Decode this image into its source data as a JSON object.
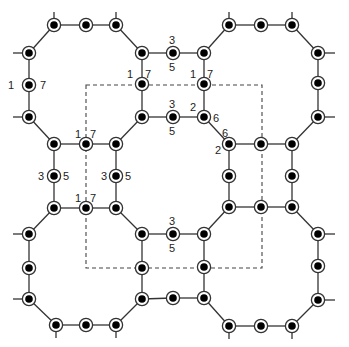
{
  "diagram": {
    "colors": {
      "line": "#333333",
      "node_fill": "#000000",
      "node_ring": "#333333",
      "dashed": "#444444",
      "label": "#222222"
    },
    "nodes": [
      {
        "id": "n1",
        "x": 54,
        "y": 25
      },
      {
        "id": "n2",
        "x": 86,
        "y": 25
      },
      {
        "id": "n3",
        "x": 116,
        "y": 25
      },
      {
        "id": "n4",
        "x": 29,
        "y": 53
      },
      {
        "id": "n5",
        "x": 142,
        "y": 53
      },
      {
        "id": "n6",
        "x": 173,
        "y": 53
      },
      {
        "id": "n7",
        "x": 29,
        "y": 85
      },
      {
        "id": "n8",
        "x": 142,
        "y": 84
      },
      {
        "id": "n9",
        "x": 29,
        "y": 117
      },
      {
        "id": "n10",
        "x": 142,
        "y": 117
      },
      {
        "id": "n11",
        "x": 173,
        "y": 117
      },
      {
        "id": "n12",
        "x": 54,
        "y": 144
      },
      {
        "id": "n13",
        "x": 86,
        "y": 144
      },
      {
        "id": "n14",
        "x": 116,
        "y": 144
      },
      {
        "id": "n15",
        "x": 54,
        "y": 176
      },
      {
        "id": "n16",
        "x": 116,
        "y": 176
      },
      {
        "id": "n17",
        "x": 54,
        "y": 208
      },
      {
        "id": "n18",
        "x": 86,
        "y": 208
      },
      {
        "id": "n19",
        "x": 116,
        "y": 208
      },
      {
        "id": "n20",
        "x": 29,
        "y": 234
      },
      {
        "id": "n21",
        "x": 142,
        "y": 234
      },
      {
        "id": "n22",
        "x": 173,
        "y": 234
      },
      {
        "id": "n23",
        "x": 29,
        "y": 268
      },
      {
        "id": "n24",
        "x": 142,
        "y": 268
      },
      {
        "id": "n25",
        "x": 29,
        "y": 299
      },
      {
        "id": "n26",
        "x": 142,
        "y": 299
      },
      {
        "id": "n27",
        "x": 173,
        "y": 298
      },
      {
        "id": "n28",
        "x": 56,
        "y": 325
      },
      {
        "id": "n29",
        "x": 86,
        "y": 325
      },
      {
        "id": "n30",
        "x": 116,
        "y": 325
      },
      {
        "id": "m1",
        "x": 229,
        "y": 25
      },
      {
        "id": "m2",
        "x": 261,
        "y": 25
      },
      {
        "id": "m3",
        "x": 292,
        "y": 25
      },
      {
        "id": "m4",
        "x": 204,
        "y": 53
      },
      {
        "id": "m5",
        "x": 318,
        "y": 53
      },
      {
        "id": "m6",
        "x": 204,
        "y": 84
      },
      {
        "id": "m7",
        "x": 318,
        "y": 83
      },
      {
        "id": "m8",
        "x": 204,
        "y": 117
      },
      {
        "id": "m9",
        "x": 318,
        "y": 117
      },
      {
        "id": "m10",
        "x": 229,
        "y": 144
      },
      {
        "id": "m11",
        "x": 261,
        "y": 144
      },
      {
        "id": "m12",
        "x": 292,
        "y": 144
      },
      {
        "id": "m13",
        "x": 229,
        "y": 176
      },
      {
        "id": "m14",
        "x": 292,
        "y": 176
      },
      {
        "id": "m15",
        "x": 229,
        "y": 207
      },
      {
        "id": "m16",
        "x": 261,
        "y": 207
      },
      {
        "id": "m17",
        "x": 292,
        "y": 207
      },
      {
        "id": "m18",
        "x": 204,
        "y": 234
      },
      {
        "id": "m19",
        "x": 318,
        "y": 234
      },
      {
        "id": "m20",
        "x": 204,
        "y": 267
      },
      {
        "id": "m21",
        "x": 318,
        "y": 266
      },
      {
        "id": "m22",
        "x": 204,
        "y": 298
      },
      {
        "id": "m23",
        "x": 318,
        "y": 300
      },
      {
        "id": "m24",
        "x": 229,
        "y": 326
      },
      {
        "id": "m25",
        "x": 261,
        "y": 326
      },
      {
        "id": "m26",
        "x": 292,
        "y": 326
      }
    ],
    "edges": [
      [
        "n1",
        "n2"
      ],
      [
        "n2",
        "n3"
      ],
      [
        "n1",
        "n4"
      ],
      [
        "n3",
        "n5"
      ],
      [
        "n4",
        "n7"
      ],
      [
        "n7",
        "n9"
      ],
      [
        "n5",
        "n8"
      ],
      [
        "n8",
        "n10"
      ],
      [
        "n9",
        "n12"
      ],
      [
        "n10",
        "n14"
      ],
      [
        "n12",
        "n13"
      ],
      [
        "n13",
        "n14"
      ],
      [
        "n5",
        "n6"
      ],
      [
        "n6",
        "m4"
      ],
      [
        "n10",
        "n11"
      ],
      [
        "n11",
        "m8"
      ],
      [
        "n12",
        "n15"
      ],
      [
        "n15",
        "n17"
      ],
      [
        "n14",
        "n16"
      ],
      [
        "n16",
        "n19"
      ],
      [
        "n17",
        "n18"
      ],
      [
        "n18",
        "n19"
      ],
      [
        "n17",
        "n20"
      ],
      [
        "n19",
        "n21"
      ],
      [
        "n20",
        "n23"
      ],
      [
        "n23",
        "n25"
      ],
      [
        "n21",
        "n24"
      ],
      [
        "n24",
        "n26"
      ],
      [
        "n25",
        "n28"
      ],
      [
        "n28",
        "n29"
      ],
      [
        "n29",
        "n30"
      ],
      [
        "n30",
        "n26"
      ],
      [
        "n21",
        "n22"
      ],
      [
        "n22",
        "m18"
      ],
      [
        "n26",
        "n27"
      ],
      [
        "n27",
        "m22"
      ],
      [
        "m1",
        "m2"
      ],
      [
        "m2",
        "m3"
      ],
      [
        "m1",
        "m4"
      ],
      [
        "m3",
        "m5"
      ],
      [
        "m4",
        "m6"
      ],
      [
        "m6",
        "m8"
      ],
      [
        "m5",
        "m7"
      ],
      [
        "m7",
        "m9"
      ],
      [
        "m8",
        "m10"
      ],
      [
        "m9",
        "m12"
      ],
      [
        "m10",
        "m11"
      ],
      [
        "m11",
        "m12"
      ],
      [
        "m10",
        "m13"
      ],
      [
        "m13",
        "m15"
      ],
      [
        "m12",
        "m14"
      ],
      [
        "m14",
        "m17"
      ],
      [
        "m15",
        "m16"
      ],
      [
        "m16",
        "m17"
      ],
      [
        "m15",
        "m18"
      ],
      [
        "m17",
        "m19"
      ],
      [
        "m18",
        "m20"
      ],
      [
        "m20",
        "m22"
      ],
      [
        "m19",
        "m21"
      ],
      [
        "m21",
        "m23"
      ],
      [
        "m22",
        "m24"
      ],
      [
        "m24",
        "m25"
      ],
      [
        "m25",
        "m26"
      ],
      [
        "m26",
        "m23"
      ]
    ],
    "stubs": [
      {
        "x1": 54,
        "y1": 25,
        "x2": 54,
        "y2": 12
      },
      {
        "x1": 116,
        "y1": 25,
        "x2": 116,
        "y2": 12
      },
      {
        "x1": 29,
        "y1": 53,
        "x2": 13,
        "y2": 53
      },
      {
        "x1": 29,
        "y1": 117,
        "x2": 13,
        "y2": 117
      },
      {
        "x1": 229,
        "y1": 25,
        "x2": 229,
        "y2": 12
      },
      {
        "x1": 292,
        "y1": 25,
        "x2": 292,
        "y2": 12
      },
      {
        "x1": 318,
        "y1": 53,
        "x2": 335,
        "y2": 53
      },
      {
        "x1": 318,
        "y1": 117,
        "x2": 335,
        "y2": 117
      },
      {
        "x1": 29,
        "y1": 234,
        "x2": 13,
        "y2": 234
      },
      {
        "x1": 29,
        "y1": 299,
        "x2": 13,
        "y2": 299
      },
      {
        "x1": 56,
        "y1": 325,
        "x2": 56,
        "y2": 338
      },
      {
        "x1": 116,
        "y1": 325,
        "x2": 116,
        "y2": 338
      },
      {
        "x1": 318,
        "y1": 234,
        "x2": 335,
        "y2": 234
      },
      {
        "x1": 318,
        "y1": 300,
        "x2": 335,
        "y2": 300
      },
      {
        "x1": 229,
        "y1": 326,
        "x2": 229,
        "y2": 339
      },
      {
        "x1": 292,
        "y1": 326,
        "x2": 292,
        "y2": 339
      },
      {
        "x1": 29,
        "y1": 117,
        "x2": 29,
        "y2": 117
      }
    ],
    "dashed_rect": {
      "x1": 86,
      "y1": 85,
      "x2": 262,
      "y2": 268
    },
    "labels": [
      {
        "text": "1",
        "x": 8,
        "y": 89
      },
      {
        "text": "7",
        "x": 40,
        "y": 89
      },
      {
        "text": "1",
        "x": 127,
        "y": 78
      },
      {
        "text": "7",
        "x": 145,
        "y": 78
      },
      {
        "text": "3",
        "x": 169,
        "y": 44
      },
      {
        "text": "5",
        "x": 169,
        "y": 71
      },
      {
        "text": "1",
        "x": 190,
        "y": 78
      },
      {
        "text": "7",
        "x": 207,
        "y": 78
      },
      {
        "text": "3",
        "x": 169,
        "y": 108
      },
      {
        "text": "5",
        "x": 169,
        "y": 135
      },
      {
        "text": "2",
        "x": 190,
        "y": 111
      },
      {
        "text": "6",
        "x": 213,
        "y": 122
      },
      {
        "text": "6",
        "x": 222,
        "y": 137
      },
      {
        "text": "2",
        "x": 215,
        "y": 154
      },
      {
        "text": "1",
        "x": 75,
        "y": 138
      },
      {
        "text": "7",
        "x": 90,
        "y": 138
      },
      {
        "text": "3",
        "x": 38,
        "y": 180
      },
      {
        "text": "5",
        "x": 63,
        "y": 180
      },
      {
        "text": "3",
        "x": 101,
        "y": 180
      },
      {
        "text": "5",
        "x": 125,
        "y": 180
      },
      {
        "text": "1",
        "x": 75,
        "y": 202
      },
      {
        "text": "7",
        "x": 90,
        "y": 202
      },
      {
        "text": "3",
        "x": 169,
        "y": 225
      },
      {
        "text": "5",
        "x": 169,
        "y": 252
      }
    ]
  }
}
